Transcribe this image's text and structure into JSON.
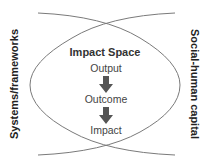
{
  "diagram": {
    "left_label": "Systems/frameworks",
    "right_label": "Social-human capital",
    "center_title": "Impact Space",
    "steps": [
      "Output",
      "Outcome",
      "Impact"
    ],
    "colors": {
      "arc": "#7a7a7a",
      "arrow": "#555555",
      "text": "#333333"
    }
  }
}
